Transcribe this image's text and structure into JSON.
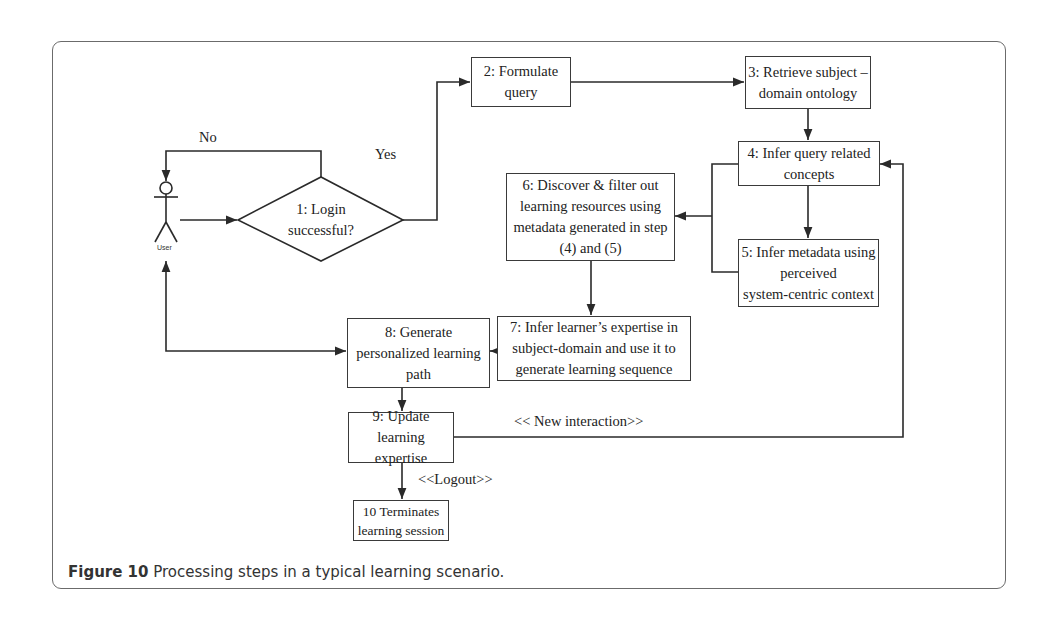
{
  "figure": {
    "caption_label": "Figure 10",
    "caption_text": " Processing steps in a typical learning scenario."
  },
  "actor": {
    "label": "User"
  },
  "decision": {
    "id": "1",
    "text": "1: Login\nsuccessful?",
    "yes_label": "Yes",
    "no_label": "No"
  },
  "steps": [
    {
      "id": "2",
      "text": "2: Formulate\nquery"
    },
    {
      "id": "3",
      "text": "3: Retrieve subject –\ndomain ontology"
    },
    {
      "id": "4",
      "text": "4: Infer query related\nconcepts"
    },
    {
      "id": "5",
      "text": "5: Infer metadata using\nperceived\nsystem-centric context"
    },
    {
      "id": "6",
      "text": "6: Discover & filter out\nlearning resources using\nmetadata generated in step\n(4) and (5)"
    },
    {
      "id": "7",
      "text": "7: Infer learner’s expertise in\nsubject-domain and use it to\ngenerate learning sequence"
    },
    {
      "id": "8",
      "text": "8: Generate\npersonalized learning\npath"
    },
    {
      "id": "9",
      "text": "9: Update\nlearning expertise"
    },
    {
      "id": "10",
      "text": "10 Terminates\nlearning session"
    }
  ],
  "edge_labels": {
    "new_interaction": "<< New interaction>>",
    "logout": "<<Logout>>"
  },
  "edges": [
    {
      "from": "User",
      "to": "1"
    },
    {
      "from": "1",
      "to": "User",
      "label": "No"
    },
    {
      "from": "1",
      "to": "2",
      "label": "Yes"
    },
    {
      "from": "2",
      "to": "3"
    },
    {
      "from": "3",
      "to": "4"
    },
    {
      "from": "4",
      "to": "5"
    },
    {
      "from": "4,5",
      "to": "6"
    },
    {
      "from": "6",
      "to": "7"
    },
    {
      "from": "7",
      "to": "8"
    },
    {
      "from": "8",
      "to": "User",
      "bidirectional": true
    },
    {
      "from": "8",
      "to": "9"
    },
    {
      "from": "9",
      "to": "4",
      "label": "<< New interaction>>"
    },
    {
      "from": "9",
      "to": "10",
      "label": "<<Logout>>"
    }
  ]
}
